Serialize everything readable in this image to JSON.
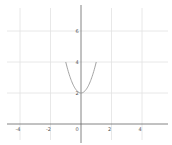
{
  "chart_data": {
    "type": "line",
    "title": "",
    "xlabel": "",
    "ylabel": "",
    "xlim": [
      -5.3,
      5.6
    ],
    "ylim": [
      -1.9,
      7.9
    ],
    "grid": true,
    "x_ticks": [
      -4,
      -2,
      0,
      2,
      4
    ],
    "y_ticks": [
      2,
      4,
      6
    ],
    "x_tick_labels": [
      "-4",
      "-2",
      "0",
      "2",
      "4"
    ],
    "y_tick_labels": [
      "2",
      "4",
      "6"
    ],
    "series": [
      {
        "name": "y = 2x^2 + 2",
        "color": "#999999",
        "x": [
          -1,
          -0.75,
          -0.5,
          -0.25,
          0,
          0.25,
          0.5,
          0.75,
          1
        ],
        "y": [
          4,
          3.125,
          2.5,
          2.125,
          2,
          2.125,
          2.5,
          3.125,
          4
        ]
      }
    ]
  },
  "colors": {
    "grid": "#e2e2e2",
    "axis": "#666666",
    "curve": "#999999",
    "label": "#555555"
  }
}
